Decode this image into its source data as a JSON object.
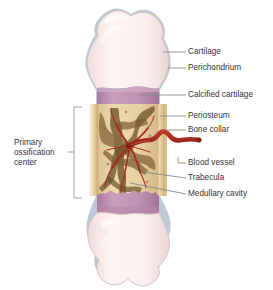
{
  "figure": {
    "background_color": "#ffffff"
  },
  "colors": {
    "cartilage": "#fbeeee",
    "cartilage_shade": "#f1dedc",
    "perichondrium": "#9fb2c4",
    "calcified_cartilage": "#c193b4",
    "calcified_cartilage_dark": "#a9789e",
    "bone_collar": "#e5cd9f",
    "bone_collar_light": "#f3e6c8",
    "medullary_cavity": "#e9d3a6",
    "trabecula": "#7a5c32",
    "trabecula_light": "#a8854f",
    "blood_vessel": "#a82b20",
    "blood_vessel_dark": "#8d1f18",
    "leader_line": "#8a8a8a",
    "bracket": "#9a9a9a",
    "text": "#333333"
  },
  "labels": {
    "right": [
      {
        "id": "cartilage",
        "text": "Cartilage"
      },
      {
        "id": "perichondrium",
        "text": "Perichondrium"
      },
      {
        "id": "calcified-cartilage",
        "text": "Calcified cartilage"
      },
      {
        "id": "periosteum",
        "text": "Periosteum"
      },
      {
        "id": "bone-collar",
        "text": "Bone collar"
      },
      {
        "id": "blood-vessel",
        "text": "Blood vessel"
      },
      {
        "id": "trabecula",
        "text": "Trabecula"
      },
      {
        "id": "medullary-cavity",
        "text": "Medullary cavity"
      }
    ],
    "left": {
      "id": "primary-ossification-center",
      "line1": "Primary",
      "line2": "ossification",
      "line3": "center"
    }
  }
}
